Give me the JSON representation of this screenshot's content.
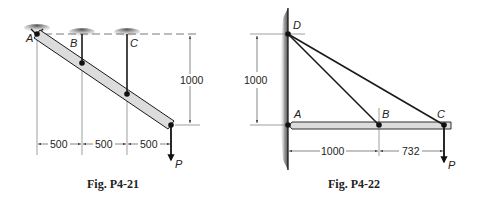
{
  "figures": [
    {
      "caption": "Fig. P4-21",
      "points": {
        "A": "A",
        "B": "B",
        "C": "C"
      },
      "load": "P",
      "dimensions": {
        "vertical": "1000",
        "horizontal": [
          "500",
          "500",
          "500"
        ]
      }
    },
    {
      "caption": "Fig. P4-22",
      "points": {
        "A": "A",
        "B": "B",
        "C": "C",
        "D": "D"
      },
      "load": "P",
      "dimensions": {
        "vertical": "1000",
        "horizontal": [
          "1000",
          "732"
        ]
      }
    }
  ],
  "colors": {
    "line": "#1a1a1a",
    "bar_fill": "#dcdcdc",
    "dim_line": "#555555",
    "wall_shade": "#8c8c8c"
  }
}
